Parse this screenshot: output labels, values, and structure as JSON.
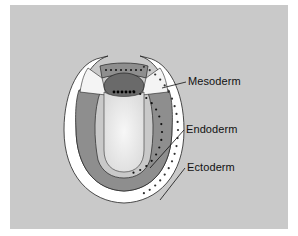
{
  "diagram": {
    "labels": [
      {
        "id": "mesoderm",
        "text": "Mesoderm"
      },
      {
        "id": "endoderm",
        "text": "Endoderm"
      },
      {
        "id": "ectoderm",
        "text": "Ectoderm"
      }
    ],
    "colors": {
      "background": "#c9c9c9",
      "ectoderm": "#ffffff",
      "endoderm": "#8e8e8e",
      "mesoderm_dark": "#6a6a6a",
      "mesoderm_light": "#f4f4f4",
      "cavity": "#ececec",
      "outline": "#222222"
    }
  }
}
